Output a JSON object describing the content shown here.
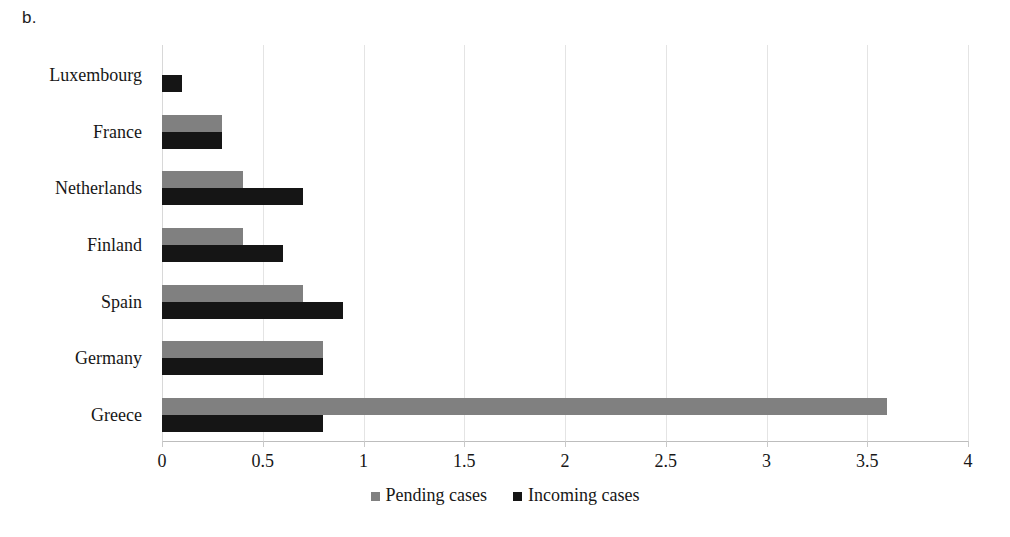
{
  "panel": {
    "label": "b."
  },
  "chart_data": {
    "type": "bar",
    "orientation": "horizontal",
    "title": "",
    "xlabel": "",
    "ylabel": "",
    "categories": [
      "Luxembourg",
      "France",
      "Netherlands",
      "Finland",
      "Spain",
      "Germany",
      "Greece"
    ],
    "series": [
      {
        "name": "Pending cases",
        "color": "#808080",
        "values": [
          0,
          0.3,
          0.4,
          0.4,
          0.7,
          0.8,
          3.6
        ]
      },
      {
        "name": "Incoming cases",
        "color": "#151515",
        "values": [
          0.1,
          0.3,
          0.7,
          0.6,
          0.9,
          0.8,
          0.8
        ]
      }
    ],
    "xlim": [
      0,
      4
    ],
    "xticks": [
      0,
      0.5,
      1,
      1.5,
      2,
      2.5,
      3,
      3.5,
      4
    ],
    "xtick_labels": [
      "0",
      "0.5",
      "1",
      "1.5",
      "2",
      "2.5",
      "3",
      "3.5",
      "4"
    ],
    "grid": "vertical",
    "legend_position": "bottom"
  }
}
